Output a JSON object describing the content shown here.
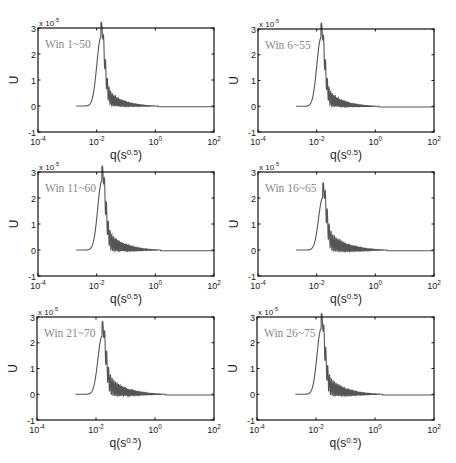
{
  "figure": {
    "panels": [
      {
        "label": "Win 1~50"
      },
      {
        "label": "Win 6~55"
      },
      {
        "label": "Win 11~60"
      },
      {
        "label": "Win 16~65"
      },
      {
        "label": "Win 21~70"
      },
      {
        "label": "Win 26~75"
      }
    ]
  },
  "chart_data": [
    {
      "type": "line",
      "title": "",
      "annotation": "Win 1~50",
      "xlabel": "q(s^0.5)",
      "ylabel": "U",
      "y_multiplier": "x 10^-5",
      "xscale": "log",
      "xlim": [
        0.0001,
        100
      ],
      "ylim": [
        -1,
        3
      ],
      "xticks": [
        "10^-4",
        "10^-2",
        "10^0",
        "10^2"
      ],
      "yticks": [
        -1,
        0,
        1,
        2,
        3
      ],
      "grid": false,
      "series": [
        {
          "name": "U",
          "start_q": 0.002,
          "peak_q": 0.014,
          "peak_u": 2.65,
          "osc_amp": 0.9,
          "osc_decay": 1.0,
          "end_q": 1.2
        }
      ]
    },
    {
      "type": "line",
      "title": "",
      "annotation": "Win 6~55",
      "xlabel": "q(s^0.5)",
      "ylabel": "U",
      "y_multiplier": "x 10^-5",
      "xscale": "log",
      "xlim": [
        0.0001,
        100
      ],
      "ylim": [
        -1,
        3
      ],
      "xticks": [
        "10^-4",
        "10^-2",
        "10^0",
        "10^2"
      ],
      "yticks": [
        -1,
        0,
        1,
        2,
        3
      ],
      "grid": false,
      "series": [
        {
          "name": "U",
          "start_q": 0.002,
          "peak_q": 0.014,
          "peak_u": 2.65,
          "osc_amp": 0.95,
          "osc_decay": 1.0,
          "end_q": 1.3
        }
      ]
    },
    {
      "type": "line",
      "title": "",
      "annotation": "Win 11~60",
      "xlabel": "q(s^0.5)",
      "ylabel": "U",
      "y_multiplier": "x 10^-5",
      "xscale": "log",
      "xlim": [
        0.0001,
        100
      ],
      "ylim": [
        -1,
        3
      ],
      "xticks": [
        "10^-4",
        "10^-2",
        "10^0",
        "10^2"
      ],
      "yticks": [
        -1,
        0,
        1,
        2,
        3
      ],
      "grid": false,
      "series": [
        {
          "name": "U",
          "start_q": 0.002,
          "peak_q": 0.015,
          "peak_u": 2.65,
          "osc_amp": 1.05,
          "osc_decay": 0.9,
          "end_q": 1.5
        }
      ]
    },
    {
      "type": "line",
      "title": "",
      "annotation": "Win 16~65",
      "xlabel": "q(s^0.5)",
      "ylabel": "U",
      "y_multiplier": "x 10^-5",
      "xscale": "log",
      "xlim": [
        0.0001,
        100
      ],
      "ylim": [
        -1,
        3
      ],
      "xticks": [
        "10^-4",
        "10^-2",
        "10^0",
        "10^2"
      ],
      "yticks": [
        -1,
        0,
        1,
        2,
        3
      ],
      "grid": false,
      "series": [
        {
          "name": "U",
          "start_q": 0.002,
          "peak_q": 0.016,
          "peak_u": 2.0,
          "osc_amp": 1.0,
          "osc_decay": 0.75,
          "end_q": 2.5
        }
      ]
    },
    {
      "type": "line",
      "title": "",
      "annotation": "Win 21~70",
      "xlabel": "q(s^0.5)",
      "ylabel": "U",
      "y_multiplier": "x 10^-5",
      "xscale": "log",
      "xlim": [
        0.0001,
        100
      ],
      "ylim": [
        -1,
        3
      ],
      "xticks": [
        "10^-4",
        "10^-2",
        "10^0",
        "10^2"
      ],
      "yticks": [
        -1,
        0,
        1,
        2,
        3
      ],
      "grid": false,
      "series": [
        {
          "name": "U",
          "start_q": 0.002,
          "peak_q": 0.016,
          "peak_u": 2.25,
          "osc_amp": 1.05,
          "osc_decay": 0.8,
          "end_q": 2.3
        }
      ]
    },
    {
      "type": "line",
      "title": "",
      "annotation": "Win 26~75",
      "xlabel": "q(s^0.5)",
      "ylabel": "U",
      "y_multiplier": "x 10^-5",
      "xscale": "log",
      "xlim": [
        0.0001,
        100
      ],
      "ylim": [
        -1,
        3
      ],
      "xticks": [
        "10^-4",
        "10^-2",
        "10^0",
        "10^2"
      ],
      "yticks": [
        -1,
        0,
        1,
        2,
        3
      ],
      "grid": false,
      "series": [
        {
          "name": "U",
          "start_q": 0.002,
          "peak_q": 0.015,
          "peak_u": 2.55,
          "osc_amp": 1.05,
          "osc_decay": 0.8,
          "end_q": 1.8
        }
      ]
    }
  ]
}
